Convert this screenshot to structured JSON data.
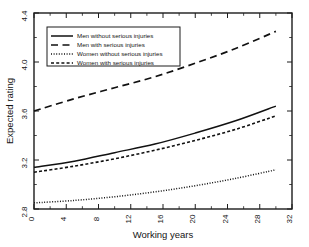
{
  "chart_data": {
    "type": "line",
    "title": "",
    "xlabel": "Working years",
    "ylabel": "Expected rating",
    "xlim": [
      0,
      32
    ],
    "ylim": [
      2.8,
      4.4
    ],
    "xticks": [
      0,
      4,
      8,
      12,
      16,
      20,
      24,
      28,
      32
    ],
    "yticks": [
      2.8,
      3.2,
      3.6,
      4.0,
      4.4
    ],
    "xticklabels": [
      "0",
      "4",
      "8",
      "12",
      "16",
      "20",
      "24",
      "28",
      "32"
    ],
    "yticklabels": [
      "2.8",
      "3.2",
      "3.6",
      "4.0",
      "4.4"
    ],
    "grid": false,
    "legend_position": "upper left (inside axes)",
    "x": [
      0,
      5,
      10,
      15,
      20,
      25,
      30
    ],
    "series": [
      {
        "name": "Men without serious injuries",
        "style": "solid",
        "values": [
          3.14,
          3.19,
          3.26,
          3.33,
          3.42,
          3.52,
          3.64
        ]
      },
      {
        "name": "Men with serious injuries",
        "style": "long-dash",
        "values": [
          3.6,
          3.7,
          3.79,
          3.88,
          3.99,
          4.11,
          4.25
        ]
      },
      {
        "name": "Women without serious injuries",
        "style": "dotted",
        "values": [
          2.85,
          2.87,
          2.9,
          2.94,
          2.99,
          3.05,
          3.12
        ]
      },
      {
        "name": "Women with serious injuries",
        "style": "short-dash",
        "values": [
          3.1,
          3.15,
          3.21,
          3.28,
          3.36,
          3.45,
          3.56
        ]
      }
    ]
  },
  "axes": {
    "xlabel": "Working years",
    "ylabel": "Expected rating"
  },
  "legend": {
    "items": [
      {
        "label": "Men without serious injuries",
        "style": "solid"
      },
      {
        "label": "Men with serious injuries",
        "style": "long-dash"
      },
      {
        "label": "Women without serious injuries",
        "style": "dotted"
      },
      {
        "label": "Women with serious injuries",
        "style": "short-dash"
      }
    ]
  },
  "ticks": {
    "x": [
      "0",
      "4",
      "8",
      "12",
      "16",
      "20",
      "24",
      "28",
      "32"
    ],
    "y": [
      "2.8",
      "3.2",
      "3.6",
      "4.0",
      "4.4"
    ]
  },
  "colors": {
    "background": "#ffffff",
    "foreground": "#111111"
  }
}
